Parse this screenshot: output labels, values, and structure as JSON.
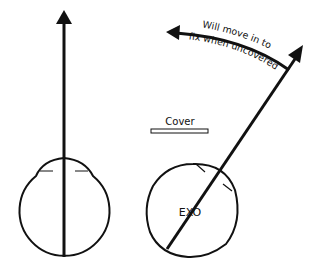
{
  "diagram": {
    "left_eye": {
      "description": "eye fixating straight ahead"
    },
    "right_eye": {
      "label": "EXO",
      "description": "eye deviated outward under cover"
    },
    "cover": {
      "label": "Cover"
    },
    "movement_arrow": {
      "line1": "Will move in to",
      "line2": "fix when uncovered"
    },
    "colors": {
      "stroke": "#111111",
      "background": "#ffffff"
    }
  }
}
